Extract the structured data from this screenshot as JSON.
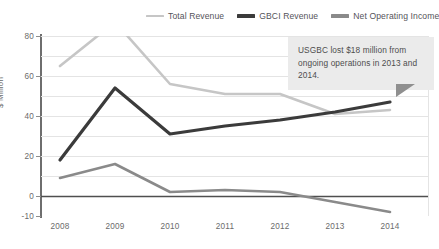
{
  "chart_data": {
    "type": "line",
    "title": "",
    "xlabel": "",
    "ylabel": "$ Million",
    "categories": [
      "2008",
      "2009",
      "2010",
      "2011",
      "2012",
      "2013",
      "2014"
    ],
    "ylim": [
      -10,
      80
    ],
    "yticks": [
      80,
      60,
      40,
      20,
      0,
      -10
    ],
    "ytick_labels": [
      "80",
      "60",
      "40",
      "20",
      "0",
      "-10"
    ],
    "grid": true,
    "legend_position": "top",
    "series": [
      {
        "name": "Total Revenue",
        "color": "#c6c6c6",
        "values": [
          65,
          87,
          56,
          51,
          51,
          41,
          43
        ]
      },
      {
        "name": "GBCI Revenue",
        "color": "#3b3b3b",
        "values": [
          18,
          54,
          31,
          35,
          38,
          42,
          47
        ]
      },
      {
        "name": "Net Operating Income",
        "color": "#8a8a8a",
        "values": [
          9,
          16,
          2,
          3,
          2,
          -3,
          -8
        ]
      }
    ],
    "annotations": [
      {
        "text": "USGBC lost $18 million from ongoing operations in 2013 and 2014.",
        "type": "callout"
      }
    ]
  },
  "legend": {
    "items": [
      {
        "label": "Total Revenue"
      },
      {
        "label": "GBCI Revenue"
      },
      {
        "label": "Net Operating Income"
      }
    ]
  },
  "axis": {
    "y_title": "$ Million",
    "y_ticks": [
      "80",
      "60",
      "40",
      "20",
      "0",
      "-10"
    ],
    "x_ticks": [
      "2008",
      "2009",
      "2010",
      "2011",
      "2012",
      "2013",
      "2014"
    ]
  },
  "callout": {
    "text": "USGBC lost $18 million from ongoing operations in 2013 and 2014."
  }
}
